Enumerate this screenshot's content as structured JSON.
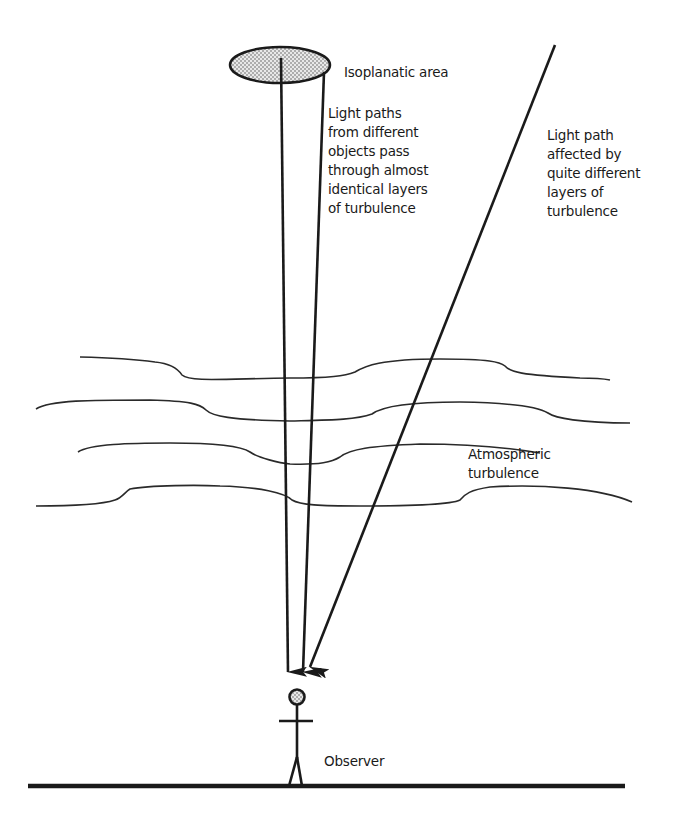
{
  "diagram": {
    "type": "schematic",
    "title": "",
    "labels": {
      "isoplanatic_area": "Isoplanatic area",
      "light_paths_same": [
        "Light paths",
        "from different",
        "objects pass",
        "through almost",
        "identical layers",
        "of turbulence"
      ],
      "light_path_different": [
        "Light path",
        "affected by",
        "quite different",
        "layers of",
        "turbulence"
      ],
      "atmospheric_turbulence": [
        "Atmospheric",
        "turbulence"
      ],
      "observer": "Observer"
    },
    "elements": {
      "isoplanatic_ellipse": {
        "cx": 280,
        "cy": 65,
        "rx": 50,
        "ry": 18,
        "fill": "stippled"
      },
      "light_rays": [
        {
          "from": [
            281,
            58
          ],
          "to": [
            288,
            672
          ],
          "arrow": true
        },
        {
          "from": [
            324,
            72
          ],
          "to": [
            303,
            672
          ],
          "arrow": true
        },
        {
          "from": [
            555,
            45
          ],
          "to": [
            309,
            668
          ],
          "arrow": true
        }
      ],
      "turbulence_layers": 4,
      "ground_line": {
        "x1": 28,
        "x2": 625,
        "y": 786
      }
    },
    "colors": {
      "ink": "#1a1a1a",
      "background": "#ffffff"
    }
  }
}
